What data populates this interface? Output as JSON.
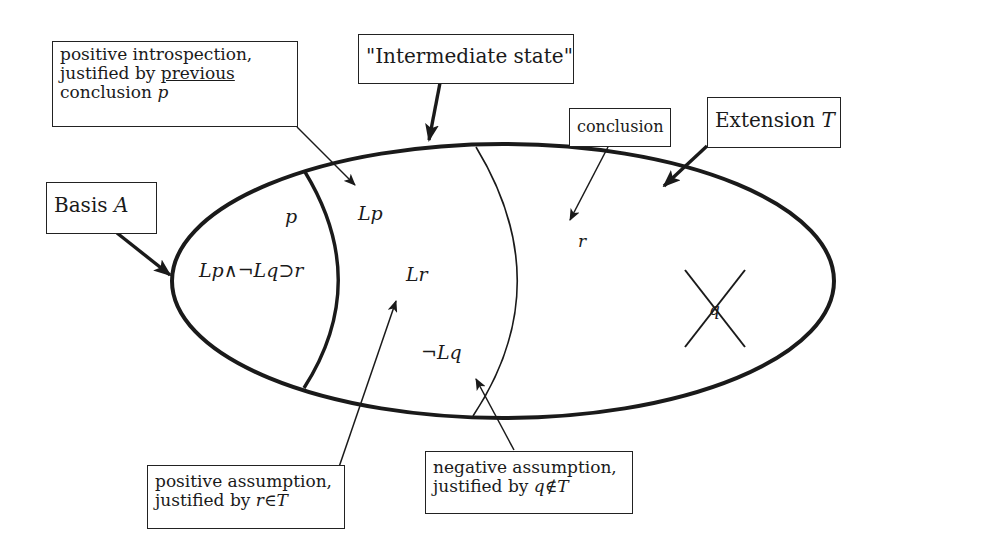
{
  "diagram": {
    "type": "nested-region diagram (autoepistemic extension)",
    "regions": {
      "outer": "Extension T",
      "inner_left": "Basis A",
      "middle": "Intermediate state"
    },
    "callouts": {
      "positive_introspection": {
        "line1": "positive introspection,",
        "line2_prefix": "justified by ",
        "line2_underlined": "previous",
        "line3_prefix": "conclusion ",
        "line3_math": "p"
      },
      "intermediate_state": {
        "text": "\"Intermediate state\""
      },
      "conclusion": {
        "text": "conclusion"
      },
      "extension": {
        "prefix": "Extension ",
        "math": "T"
      },
      "basis": {
        "prefix": "Basis ",
        "math": "A"
      },
      "positive_assumption": {
        "line1": "positive assumption,",
        "line2_prefix": "justified by ",
        "line2_math": "r∈T"
      },
      "negative_assumption": {
        "line1": "negative assumption,",
        "line2_prefix": "justified by ",
        "line2_math": "q∉T"
      }
    },
    "formulas": {
      "p": "p",
      "rule": "Lp∧¬Lq⊃r",
      "Lp": "Lp",
      "Lr": "Lr",
      "notLq": "¬Lq",
      "r": "r",
      "q_crossed": "q"
    },
    "colors": {
      "ink": "#1a1a1a",
      "background": "#ffffff"
    }
  }
}
